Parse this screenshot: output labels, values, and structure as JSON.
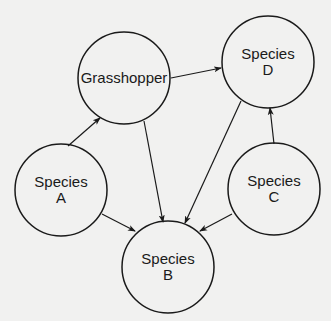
{
  "diagram": {
    "type": "food-web",
    "background_color": "#f1f1f0",
    "stroke_color": "#1a1a1a",
    "nodes": [
      {
        "id": "grasshopper",
        "lines": [
          "Grasshopper"
        ],
        "cx": 124,
        "cy": 78,
        "r": 46
      },
      {
        "id": "species_d",
        "lines": [
          "Species",
          "D"
        ],
        "cx": 268,
        "cy": 62,
        "r": 46
      },
      {
        "id": "species_a",
        "lines": [
          "Species",
          "A"
        ],
        "cx": 61,
        "cy": 190,
        "r": 46
      },
      {
        "id": "species_c",
        "lines": [
          "Species",
          "C"
        ],
        "cx": 274,
        "cy": 189,
        "r": 46
      },
      {
        "id": "species_b",
        "lines": [
          "Species",
          "B"
        ],
        "cx": 168,
        "cy": 267,
        "r": 46
      }
    ],
    "edges": [
      {
        "from": "species_a",
        "to": "grasshopper",
        "x1": 68,
        "y1": 146,
        "x2": 100,
        "y2": 118
      },
      {
        "from": "grasshopper",
        "to": "species_d",
        "x1": 171,
        "y1": 78,
        "x2": 221,
        "y2": 68
      },
      {
        "from": "grasshopper",
        "to": "species_b",
        "x1": 144,
        "y1": 121,
        "x2": 163,
        "y2": 222
      },
      {
        "from": "species_d",
        "to": "species_b",
        "x1": 241,
        "y1": 101,
        "x2": 185,
        "y2": 223
      },
      {
        "from": "species_c",
        "to": "species_d",
        "x1": 274,
        "y1": 144,
        "x2": 270,
        "y2": 108
      },
      {
        "from": "species_a",
        "to": "species_b",
        "x1": 102,
        "y1": 214,
        "x2": 135,
        "y2": 231
      },
      {
        "from": "species_c",
        "to": "species_b",
        "x1": 232,
        "y1": 214,
        "x2": 200,
        "y2": 231
      }
    ]
  }
}
